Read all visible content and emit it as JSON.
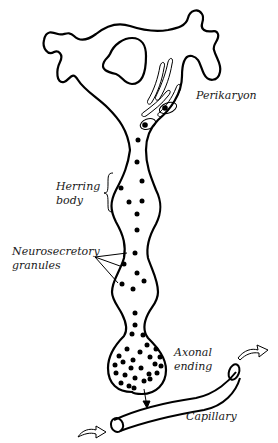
{
  "diagram": {
    "labels": {
      "perikaryon": "Perikaryon",
      "herring_body_line1": "Herring",
      "herring_body_line2": "body",
      "neurosecretory_line1": "Neurosecretory",
      "neurosecretory_line2": "granules",
      "axonal_line1": "Axonal",
      "axonal_line2": "ending",
      "capillary": "Capillary"
    },
    "colors": {
      "stroke": "#000000",
      "background": "#ffffff"
    }
  }
}
